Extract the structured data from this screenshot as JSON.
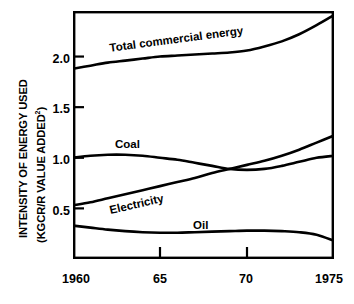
{
  "chart_data": {
    "type": "line",
    "title": "",
    "xlabel": "",
    "ylabel_line1": "INTENSITY OF ENERGY USED",
    "ylabel_line2_prefix": "(KGCR/R VALUE ADDED",
    "ylabel_line2_superscript": "2",
    "ylabel_line2_suffix": ")",
    "grid": false,
    "legend_position": "inline-curve-labels",
    "xlim": [
      1960,
      1975
    ],
    "ylim": [
      0.0,
      2.45
    ],
    "xticks": [
      1960,
      1965,
      1970,
      1975
    ],
    "xtick_labels": [
      "1960",
      "65",
      "70",
      "1975"
    ],
    "yticks": [
      0.5,
      1.0,
      1.5,
      2.0
    ],
    "ytick_labels": [
      "0.5",
      "1.0",
      "1.5",
      "2.0"
    ],
    "line_color": "#000000",
    "x": [
      1960,
      1961,
      1962,
      1963,
      1964,
      1965,
      1966,
      1967,
      1968,
      1969,
      1970,
      1971,
      1972,
      1973,
      1974,
      1975
    ],
    "series": [
      {
        "name": "Total commercial energy",
        "label": "Total commercial energy",
        "values": [
          1.88,
          1.91,
          1.94,
          1.96,
          1.98,
          2.0,
          2.01,
          2.02,
          2.03,
          2.04,
          2.06,
          2.1,
          2.15,
          2.22,
          2.31,
          2.41
        ]
      },
      {
        "name": "Coal",
        "label": "Coal",
        "values": [
          1.0,
          1.02,
          1.03,
          1.03,
          1.02,
          1.0,
          0.98,
          0.95,
          0.92,
          0.89,
          0.88,
          0.89,
          0.92,
          0.96,
          1.0,
          1.02
        ]
      },
      {
        "name": "Electricity",
        "label": "Electricity",
        "values": [
          0.53,
          0.56,
          0.6,
          0.64,
          0.68,
          0.72,
          0.76,
          0.8,
          0.85,
          0.89,
          0.93,
          0.97,
          1.02,
          1.08,
          1.15,
          1.22
        ]
      },
      {
        "name": "Oil",
        "label": "Oil",
        "values": [
          0.33,
          0.31,
          0.29,
          0.275,
          0.265,
          0.26,
          0.26,
          0.265,
          0.27,
          0.275,
          0.28,
          0.28,
          0.275,
          0.265,
          0.24,
          0.18
        ]
      }
    ]
  },
  "axis": {
    "ytick_labels": [
      "2.0",
      "1.5",
      "1.0",
      "0.5"
    ],
    "xtick_labels": [
      "1960",
      "65",
      "70",
      "1975"
    ]
  },
  "footer": {
    "partial_text": ""
  }
}
